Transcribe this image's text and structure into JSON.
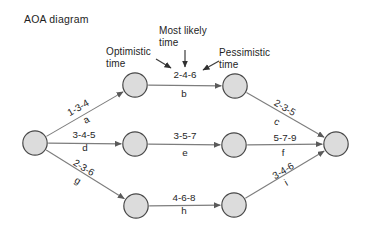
{
  "title": "AOA diagram",
  "annotations": {
    "optimistic": "Optimistic\ntime",
    "most_likely": "Most likely\ntime",
    "pessimistic": "Pessimistic\ntime"
  },
  "diagram": {
    "type": "activity-on-arrow-network",
    "node_radius": 12.2,
    "nodes": [
      {
        "id": "start",
        "x": 35,
        "y": 143
      },
      {
        "id": "top-left",
        "x": 135,
        "y": 85
      },
      {
        "id": "top-right",
        "x": 235,
        "y": 86
      },
      {
        "id": "mid-left",
        "x": 135,
        "y": 144
      },
      {
        "id": "mid-right",
        "x": 234,
        "y": 145
      },
      {
        "id": "bottom-left",
        "x": 136,
        "y": 206
      },
      {
        "id": "bottom-right",
        "x": 234,
        "y": 205
      },
      {
        "id": "end",
        "x": 336,
        "y": 144
      }
    ],
    "edges": [
      {
        "id": "a",
        "from": "start",
        "to": "top-left",
        "duration": "1-3-4",
        "letter": "a",
        "dur_pos": [
          78,
          111
        ],
        "letter_pos": [
          86,
          123
        ],
        "angle": -30
      },
      {
        "id": "b",
        "from": "top-left",
        "to": "top-right",
        "duration": "2-4-6",
        "letter": "b",
        "dur_pos": [
          185,
          78
        ],
        "letter_pos": [
          184,
          97
        ],
        "angle": 0
      },
      {
        "id": "c",
        "from": "top-right",
        "to": "end",
        "duration": "2-3-5",
        "letter": "c",
        "dur_pos": [
          285,
          111
        ],
        "letter_pos": [
          277,
          125
        ],
        "angle": 30
      },
      {
        "id": "d",
        "from": "start",
        "to": "mid-left",
        "duration": "3-4-5",
        "letter": "d",
        "dur_pos": [
          84,
          138
        ],
        "letter_pos": [
          85,
          151
        ],
        "angle": 0
      },
      {
        "id": "e",
        "from": "mid-left",
        "to": "mid-right",
        "duration": "3-5-7",
        "letter": "e",
        "dur_pos": [
          185,
          139
        ],
        "letter_pos": [
          185,
          156
        ],
        "angle": 0
      },
      {
        "id": "f",
        "from": "mid-right",
        "to": "end",
        "duration": "5-7-9",
        "letter": "f",
        "dur_pos": [
          285,
          141
        ],
        "letter_pos": [
          283,
          156
        ],
        "angle": 0
      },
      {
        "id": "g",
        "from": "start",
        "to": "bottom-left",
        "duration": "2-3-6",
        "letter": "g",
        "dur_pos": [
          84,
          171
        ],
        "letter_pos": [
          78,
          184
        ],
        "angle": 31
      },
      {
        "id": "h",
        "from": "bottom-left",
        "to": "bottom-right",
        "duration": "4-6-8",
        "letter": "h",
        "dur_pos": [
          184,
          201
        ],
        "letter_pos": [
          184,
          214
        ],
        "angle": 0
      },
      {
        "id": "i",
        "from": "bottom-right",
        "to": "end",
        "duration": "3-4-6",
        "letter": "i",
        "dur_pos": [
          283,
          174
        ],
        "letter_pos": [
          286,
          186
        ],
        "angle": -31
      }
    ],
    "annotation_arrows": [
      {
        "id": "most-likely-arrow",
        "x1": 185,
        "y1": 50,
        "x2": 185,
        "y2": 67
      },
      {
        "id": "optimistic-arrow",
        "x1": 156,
        "y1": 59,
        "x2": 171,
        "y2": 68
      },
      {
        "id": "pessimistic-arrow",
        "x1": 219,
        "y1": 61,
        "x2": 203,
        "y2": 70
      }
    ]
  }
}
